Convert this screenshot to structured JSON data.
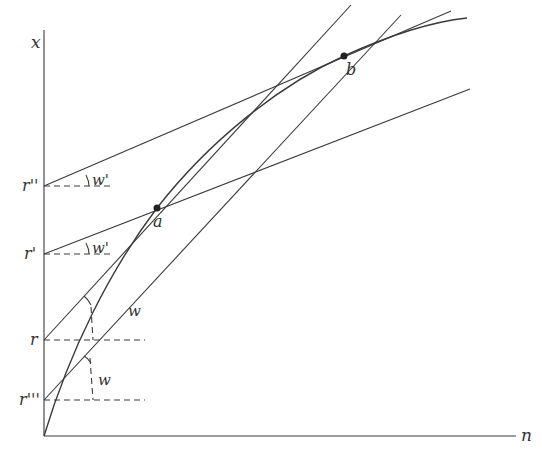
{
  "diagram": {
    "axes": {
      "y_label": "x",
      "x_label": "n"
    },
    "intercepts": {
      "r_double_prime": "r''",
      "r_prime": "r'",
      "r": "r",
      "r_triple_prime": "r'''"
    },
    "points": {
      "a": "a",
      "b": "b"
    },
    "angle_labels": {
      "w_prime_upper": "w'",
      "w_prime_lower": "w'",
      "w_line": "w",
      "w_angle": "w"
    },
    "colors": {
      "line": "#3a3a3a",
      "text": "#333333",
      "background": "#ffffff"
    }
  }
}
